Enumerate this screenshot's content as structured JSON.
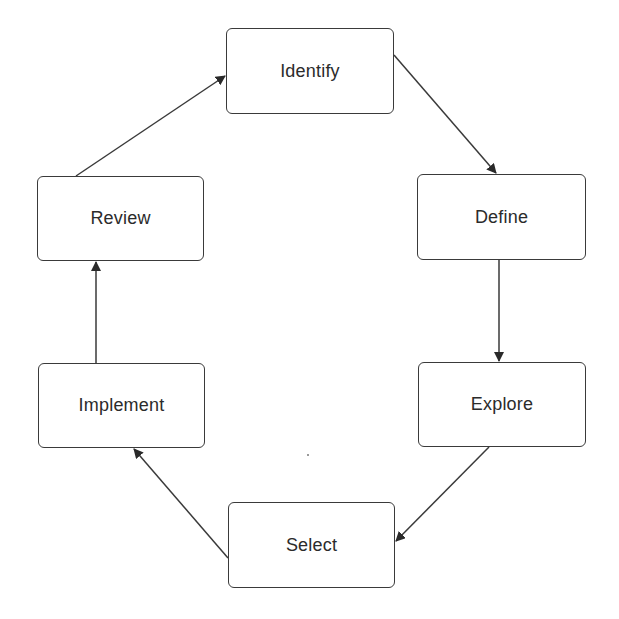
{
  "diagram": {
    "type": "cycle",
    "nodes": [
      {
        "id": "identify",
        "label": "Identify",
        "x": 226,
        "y": 28,
        "w": 168,
        "h": 86
      },
      {
        "id": "define",
        "label": "Define",
        "x": 417,
        "y": 174,
        "w": 169,
        "h": 86
      },
      {
        "id": "explore",
        "label": "Explore",
        "x": 418,
        "y": 362,
        "w": 168,
        "h": 85
      },
      {
        "id": "select",
        "label": "Select",
        "x": 228,
        "y": 502,
        "w": 167,
        "h": 86
      },
      {
        "id": "implement",
        "label": "Implement",
        "x": 38,
        "y": 363,
        "w": 167,
        "h": 85
      },
      {
        "id": "review",
        "label": "Review",
        "x": 37,
        "y": 176,
        "w": 167,
        "h": 85
      }
    ],
    "edges": [
      {
        "from": "identify",
        "to": "define",
        "x1": 394,
        "y1": 55,
        "x2": 496,
        "y2": 173
      },
      {
        "from": "define",
        "to": "explore",
        "x1": 499,
        "y1": 260,
        "x2": 499,
        "y2": 361
      },
      {
        "from": "explore",
        "to": "select",
        "x1": 489,
        "y1": 447,
        "x2": 396,
        "y2": 541
      },
      {
        "from": "select",
        "to": "implement",
        "x1": 228,
        "y1": 558,
        "x2": 134,
        "y2": 449
      },
      {
        "from": "implement",
        "to": "review",
        "x1": 96,
        "y1": 363,
        "x2": 96,
        "y2": 262
      },
      {
        "from": "review",
        "to": "identify",
        "x1": 76,
        "y1": 176,
        "x2": 225,
        "y2": 76
      }
    ],
    "colors": {
      "stroke": "#3a3a3a",
      "text": "#2b2b2b",
      "background": "#ffffff"
    }
  }
}
